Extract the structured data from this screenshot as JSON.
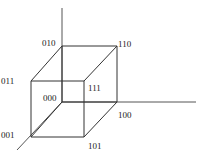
{
  "diagram": {
    "type": "3-bit binary cube (hypercube)",
    "colors": {
      "line": "#333333",
      "axis": "#555555",
      "text": "#222222",
      "background": "#ffffff"
    },
    "vertices": [
      {
        "id": "000",
        "label": "000",
        "x": 62,
        "y": 102,
        "lx": 43,
        "ly": 101
      },
      {
        "id": "100",
        "label": "100",
        "x": 117,
        "y": 102,
        "lx": 118,
        "ly": 118
      },
      {
        "id": "010",
        "label": "010",
        "x": 62,
        "y": 46,
        "lx": 42,
        "ly": 46
      },
      {
        "id": "110",
        "label": "110",
        "x": 117,
        "y": 46,
        "lx": 118,
        "ly": 47
      },
      {
        "id": "001",
        "label": "001",
        "x": 31,
        "y": 137,
        "lx": 1,
        "ly": 138
      },
      {
        "id": "101",
        "label": "101",
        "x": 84,
        "y": 137,
        "lx": 88,
        "ly": 149
      },
      {
        "id": "011",
        "label": "011",
        "x": 31,
        "y": 81,
        "lx": 1,
        "ly": 84
      },
      {
        "id": "111",
        "label": "111",
        "x": 84,
        "y": 81,
        "lx": 88,
        "ly": 91
      }
    ],
    "edges": [
      [
        "000",
        "100"
      ],
      [
        "000",
        "010"
      ],
      [
        "000",
        "001"
      ],
      [
        "100",
        "110"
      ],
      [
        "100",
        "101"
      ],
      [
        "010",
        "110"
      ],
      [
        "010",
        "011"
      ],
      [
        "001",
        "101"
      ],
      [
        "001",
        "011"
      ],
      [
        "110",
        "111"
      ],
      [
        "101",
        "111"
      ],
      [
        "011",
        "111"
      ]
    ],
    "axes": [
      {
        "name": "x-axis",
        "x1": 62,
        "y1": 102,
        "x2": 196,
        "y2": 102
      },
      {
        "name": "y-axis",
        "x1": 62,
        "y1": 102,
        "x2": 62,
        "y2": 8
      },
      {
        "name": "z-axis",
        "x1": 62,
        "y1": 102,
        "x2": 17,
        "y2": 150
      }
    ]
  }
}
